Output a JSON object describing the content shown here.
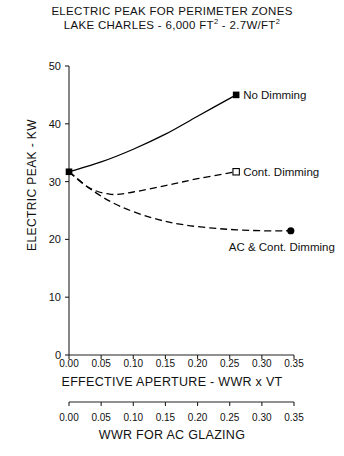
{
  "chart_data": {
    "type": "line",
    "title": "ELECTRIC PEAK FOR PERIMETER ZONES",
    "subtitle": "LAKE CHARLES - 6,000 FT² - 2.7W/FT²",
    "title_line1": "ELECTRIC PEAK FOR PERIMETER ZONES",
    "title_line2_a": "LAKE CHARLES - 6,000 FT",
    "title_line2_sup1": "2",
    "title_line2_b": " - 2.7W/FT",
    "title_line2_sup2": "2",
    "xlabel": "EFFECTIVE APERTURE - WWR x VT",
    "xlabel2": "WWR FOR AC GLAZING",
    "ylabel": "ELECTRIC PEAK - KW",
    "xlim": [
      0.0,
      0.35
    ],
    "ylim": [
      0,
      50
    ],
    "grid": false,
    "legend_position": "inline-right-of-endpoint",
    "xticks": [
      "0.00",
      "0.05",
      "0.10",
      "0.15",
      "0.20",
      "0.25",
      "0.30",
      "0.35"
    ],
    "xtickvalues": [
      0.0,
      0.05,
      0.1,
      0.15,
      0.2,
      0.25,
      0.3,
      0.35
    ],
    "xticks2": [
      "0.00",
      "0.05",
      "0.10",
      "0.15",
      "0.20",
      "0.25",
      "0.30",
      "0.35"
    ],
    "yticks": [
      "0",
      "10",
      "20",
      "30",
      "40",
      "50"
    ],
    "ytickvalues": [
      0,
      10,
      20,
      30,
      40,
      50
    ],
    "series": [
      {
        "name": "No Dimming",
        "label": "No Dimming",
        "linestyle": "solid",
        "marker": "filled-square",
        "color": "#000000",
        "x": [
          0.0,
          0.05,
          0.1,
          0.15,
          0.2,
          0.26
        ],
        "values": [
          31.7,
          33.4,
          35.6,
          38.2,
          41.3,
          45.0
        ],
        "endpoint": {
          "x": 0.26,
          "y": 45.0
        }
      },
      {
        "name": "Cont. Dimming",
        "label": "Cont. Dimming",
        "linestyle": "dashed",
        "marker": "open-square",
        "color": "#000000",
        "x": [
          0.0,
          0.03,
          0.065,
          0.1,
          0.15,
          0.2,
          0.26
        ],
        "values": [
          31.7,
          29.0,
          27.8,
          28.2,
          29.3,
          30.5,
          31.7
        ],
        "endpoint": {
          "x": 0.26,
          "y": 31.7
        }
      },
      {
        "name": "AC & Cont. Dimming",
        "label": "AC & Cont. Dimming",
        "linestyle": "dashed",
        "marker": "filled-circle",
        "color": "#000000",
        "x": [
          0.0,
          0.04,
          0.08,
          0.13,
          0.18,
          0.24,
          0.3,
          0.345
        ],
        "values": [
          31.7,
          28.2,
          25.7,
          23.7,
          22.5,
          21.8,
          21.5,
          21.5
        ],
        "endpoint": {
          "x": 0.345,
          "y": 21.5
        }
      }
    ]
  },
  "labels": {
    "no_dimming": "No Dimming",
    "cont_dimming": "Cont. Dimming",
    "ac_cont_dimming": "AC & Cont. Dimming"
  }
}
